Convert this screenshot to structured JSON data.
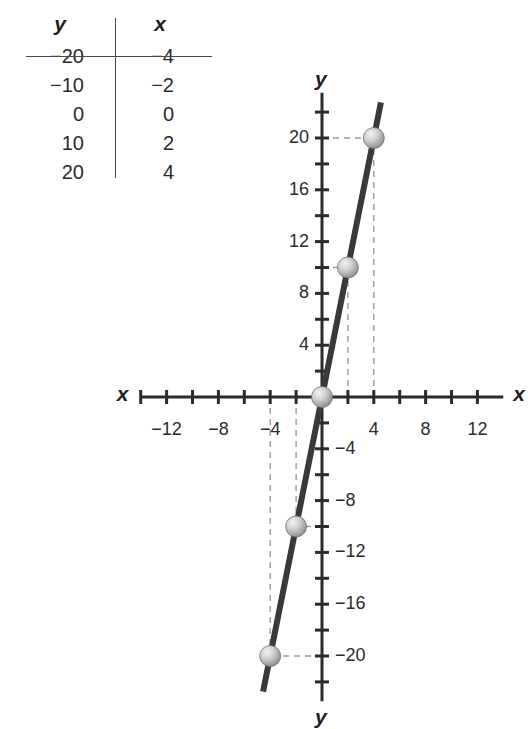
{
  "table": {
    "headers": [
      "y",
      "x"
    ],
    "rows": [
      {
        "y": "−20",
        "x": "−4"
      },
      {
        "y": "−10",
        "x": "−2"
      },
      {
        "y": "0",
        "x": "0"
      },
      {
        "y": "10",
        "x": "2"
      },
      {
        "y": "20",
        "x": "4"
      }
    ]
  },
  "chart_data": {
    "type": "line",
    "title": "",
    "xlabel": "x",
    "ylabel": "y",
    "xlim": [
      -14,
      14
    ],
    "ylim": [
      -22,
      22
    ],
    "x_tick_labels": [
      "−12",
      "−8",
      "−4",
      "4",
      "8",
      "12"
    ],
    "x_tick_values": [
      -12,
      -8,
      -4,
      4,
      8,
      12
    ],
    "x_minor_tick_values": [
      -14,
      -12,
      -10,
      -8,
      -6,
      -4,
      -2,
      2,
      4,
      6,
      8,
      10,
      12
    ],
    "y_tick_labels": [
      "20",
      "16",
      "12",
      "8",
      "4",
      "−4",
      "−8",
      "−12",
      "−16",
      "−20"
    ],
    "y_tick_values": [
      20,
      16,
      12,
      8,
      4,
      -4,
      -8,
      -12,
      -16,
      -20
    ],
    "y_minor_tick_values": [
      22,
      20,
      18,
      16,
      14,
      12,
      10,
      8,
      6,
      4,
      2,
      -2,
      -4,
      -6,
      -8,
      -10,
      -12,
      -14,
      -16,
      -18,
      -20,
      -22
    ],
    "grid": false,
    "legend": null,
    "series": [
      {
        "name": "y = 5x",
        "x": [
          -4,
          -2,
          0,
          2,
          4
        ],
        "values": [
          -20,
          -10,
          0,
          10,
          20
        ],
        "marker": "sphere",
        "line_color": "#3a3a3a",
        "marker_color": "#b0b0b0"
      }
    ],
    "guide_lines": {
      "style": "dashed",
      "color": "#9a9a9a",
      "points": [
        {
          "x": -4,
          "y": -20
        },
        {
          "x": -2,
          "y": -10
        },
        {
          "x": 2,
          "y": 10
        },
        {
          "x": 4,
          "y": 20
        }
      ]
    },
    "axis_label_left": "x",
    "axis_label_right": "x",
    "axis_label_top": "y",
    "axis_label_bottom": "y"
  },
  "colors": {
    "line": "#3a3a3a",
    "axis": "#2b2b2b",
    "guide": "#9a9a9a",
    "marker_light": "#e2e2e2",
    "marker_dark": "#8f8f8f"
  }
}
